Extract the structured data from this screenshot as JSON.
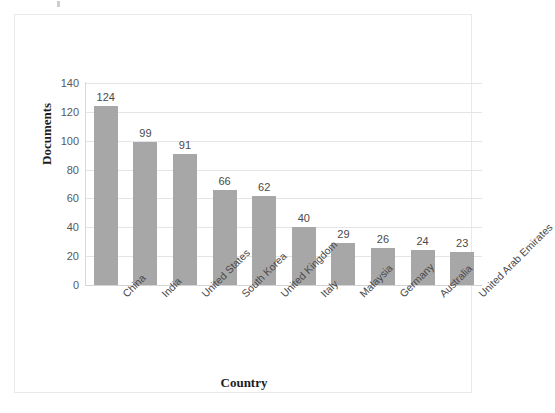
{
  "chart_data": {
    "type": "bar",
    "title": "",
    "xlabel": "Country",
    "ylabel": "Documents",
    "categories": [
      "China",
      "India",
      "United States",
      "South Korea",
      "United Kingdom",
      "Italy",
      "Malaysia",
      "Germany",
      "Australia",
      "United Arab Emirates"
    ],
    "values": [
      124,
      99,
      91,
      66,
      62,
      40,
      29,
      26,
      24,
      23
    ],
    "data_labels": [
      "124",
      "99",
      "91",
      "66",
      "62",
      "40",
      "29",
      "26",
      "24",
      "23"
    ],
    "ylim": [
      0,
      140
    ],
    "ytick_values": [
      0,
      20,
      40,
      60,
      80,
      100,
      120,
      140
    ],
    "ytick_labels": [
      "0",
      "20",
      "40",
      "60",
      "80",
      "100",
      "120",
      "140"
    ],
    "grid": "horizontal",
    "legend": "none",
    "bar_color": "#a7a7a7",
    "gridline_color": "#e4e4e6",
    "frame_color": "#e9e9ec",
    "label_rotation_deg": -45
  }
}
